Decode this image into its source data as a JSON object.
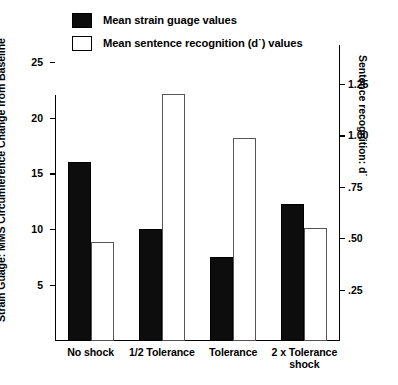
{
  "chart_data": {
    "type": "bar",
    "title": "",
    "categories": [
      "No shock",
      "1/2 Tolerance",
      "Tolerance",
      "2 x Tolerance shock"
    ],
    "series": [
      {
        "name": "Mean strain guage values",
        "axis": "left",
        "color": "#0d0d0d",
        "style": "filled",
        "values": [
          16.0,
          10.0,
          7.5,
          12.3
        ]
      },
      {
        "name": "Mean sentence recognition (d˙) values",
        "axis": "right",
        "color": "#ffffff",
        "style": "hollow",
        "values": [
          0.48,
          1.2,
          0.99,
          0.55
        ]
      }
    ],
    "xlabel": "",
    "ylabel": "Strain Guage: MMS Circumference Change from Baseline",
    "ylabel_right": "Sentence recognition: d˙",
    "ylim": [
      0,
      26.5
    ],
    "ylim_right": [
      0,
      1.44
    ],
    "yticks": [
      5,
      10,
      15,
      20,
      25
    ],
    "ytick_labels": [
      "5",
      "10",
      "15",
      "20",
      "25"
    ],
    "yticks_right": [
      0.25,
      0.5,
      0.75,
      1.0,
      1.25
    ],
    "ytick_labels_right": [
      ".25",
      ".50",
      ".75",
      "1.00",
      "1.25"
    ],
    "grid": false,
    "legend_position": "top"
  },
  "legend": {
    "items": [
      {
        "label": "Mean strain guage values",
        "swatch": "filled"
      },
      {
        "label": "Mean sentence recognition (d˙) values",
        "swatch": "hollow"
      }
    ]
  },
  "axes": {
    "left_title": "Strain Guage: MMS Circumference Change from Baseline",
    "right_title": "Sentence recognition: d˙",
    "left_ticks": [
      {
        "label": "25",
        "value": 25
      },
      {
        "label": "20",
        "value": 20
      },
      {
        "label": "15",
        "value": 15
      },
      {
        "label": "10",
        "value": 10
      },
      {
        "label": "5",
        "value": 5
      }
    ],
    "right_ticks": [
      {
        "label": "1.25",
        "value": 1.25
      },
      {
        "label": "1.00",
        "value": 1.0
      },
      {
        "label": ".75",
        "value": 0.75
      },
      {
        "label": ".50",
        "value": 0.5
      },
      {
        "label": ".25",
        "value": 0.25
      }
    ]
  },
  "categories": [
    {
      "line1": "No shock",
      "line2": ""
    },
    {
      "line1": "1/2 Tolerance",
      "line2": ""
    },
    {
      "line1": "Tolerance",
      "line2": ""
    },
    {
      "line1": "2 x Tolerance",
      "line2": "shock"
    }
  ]
}
